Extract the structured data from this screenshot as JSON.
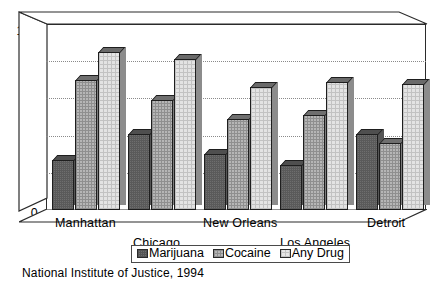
{
  "chart_data": {
    "type": "bar",
    "title": "",
    "subtitle": "",
    "xlabel": "",
    "ylabel": "",
    "ylim": [
      0,
      100
    ],
    "yticks": [
      0,
      20,
      40,
      60,
      80,
      100
    ],
    "grid": true,
    "legend_position": "bottom",
    "style": "3d-clustered-column",
    "categories": [
      "Manhattan",
      "Chicago",
      "New Orleans",
      "Los Angeles",
      "Detroit"
    ],
    "series": [
      {
        "name": "Marijuana",
        "values": [
          27,
          41,
          30,
          24,
          41
        ],
        "color": "#6e6e6e"
      },
      {
        "name": "Cocaine",
        "values": [
          70,
          59,
          49,
          51,
          36
        ],
        "color": "#b6b6b6"
      },
      {
        "name": "Any Drug",
        "values": [
          85,
          81,
          66,
          69,
          68
        ],
        "color": "#e3e3e3"
      }
    ],
    "source_note": "National Institute of Justice, 1994"
  },
  "axis": {
    "y_tick_labels": [
      "100",
      "80",
      "60",
      "40",
      "20",
      "0"
    ]
  },
  "xaxis": {
    "labels": [
      {
        "text": "Manhattan"
      },
      {
        "text": "Chicago"
      },
      {
        "text": "New Orleans"
      },
      {
        "text": "Los Angeles"
      },
      {
        "text": "Detroit"
      }
    ]
  },
  "legend": {
    "items": [
      {
        "label": "Marijuana"
      },
      {
        "label": "Cocaine"
      },
      {
        "label": "Any Drug"
      }
    ]
  },
  "caption": {
    "text": "National Institute of Justice, 1994"
  }
}
